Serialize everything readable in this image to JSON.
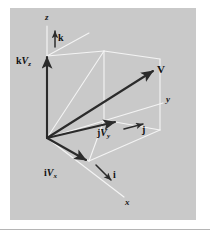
{
  "figure": {
    "type": "vector-decomposition-diagram",
    "background_color": "#c9c9c9",
    "page_color": "#ffffff",
    "vector_color": "#2b2b2b",
    "wireframe_color": "#f2f2f2",
    "axes": [
      {
        "name": "z-axis",
        "label": "z",
        "x": 47,
        "y": 18
      },
      {
        "name": "y-axis",
        "label": "y",
        "x": 166,
        "y": 99
      },
      {
        "name": "x-axis",
        "label": "x",
        "x": 127,
        "y": 202
      }
    ],
    "unit_vectors": [
      {
        "name": "k-unit-vector",
        "label": "k",
        "x": 58,
        "y": 38
      },
      {
        "name": "j-unit-vector",
        "label": "j",
        "x": 140,
        "y": 130
      },
      {
        "name": "i-unit-vector",
        "label": "i",
        "x": 112,
        "y": 176
      }
    ],
    "resultant": {
      "name": "resultant-vector",
      "label": "V",
      "x": 159,
      "y": 70
    },
    "components": [
      {
        "name": "z-component-label",
        "unit": "k",
        "magnitude": "V",
        "subscript": "z",
        "x": 16,
        "y": 61
      },
      {
        "name": "y-component-label",
        "unit": "j",
        "magnitude": "V",
        "subscript": "y",
        "x": 98,
        "y": 132
      },
      {
        "name": "x-component-label",
        "unit": "i",
        "magnitude": "V",
        "subscript": "x",
        "x": 44,
        "y": 172
      }
    ]
  }
}
